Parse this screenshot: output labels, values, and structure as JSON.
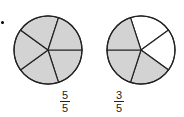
{
  "colors": {
    "shaded": "#d3d3d3",
    "unshaded": "#ffffff",
    "stroke": "#222222"
  },
  "figures": [
    {
      "name": "circle-left",
      "parts": 5,
      "shaded_parts": 5,
      "shaded_sectors": [
        0,
        1,
        2,
        3,
        4
      ],
      "fraction": {
        "numerator": "5",
        "denominator": "5"
      }
    },
    {
      "name": "circle-right",
      "parts": 5,
      "shaded_parts": 3,
      "shaded_sectors": [
        2,
        3,
        4
      ],
      "fraction": {
        "numerator": "3",
        "denominator": "5"
      }
    }
  ],
  "comparison": {
    "symbol": "placeholder-box"
  }
}
